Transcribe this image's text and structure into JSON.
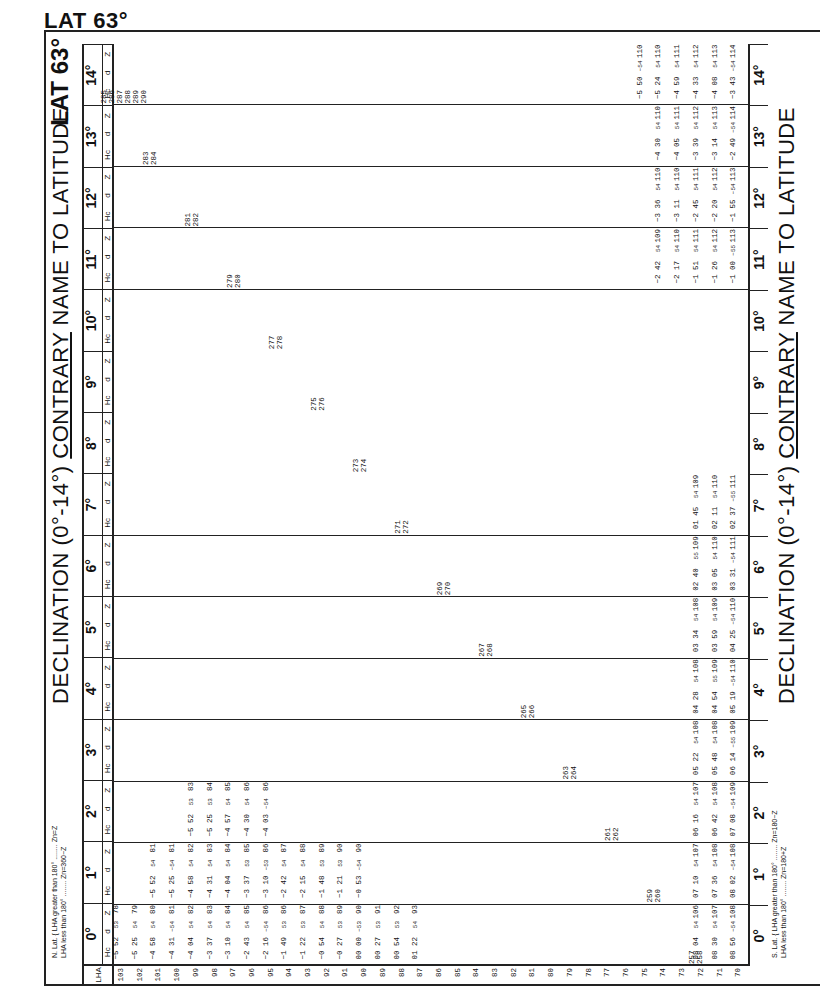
{
  "page": {
    "top_title": "LAT 63°",
    "side_title": "LAT 63°",
    "header_title_prefix": "DECLINATION (0°-14°)",
    "header_title_emph": "CONTRARY",
    "header_title_suffix": "NAME TO LATITUDE",
    "n_lat_rule_1": "N. Lat. { LHA greater than 180° ........ Zn=Z",
    "n_lat_rule_2": "LHA less than 180° ........ Zn=360−Z",
    "s_lat_rule_1": "S. Lat. { LHA greater than 180° ........ Zn=180−Z",
    "s_lat_rule_2": "LHA less than 180° ........ Zn=180+Z",
    "lha_label": "LHA",
    "subheads": {
      "hc": "Hc",
      "d": "d",
      "z": "Z"
    },
    "units": {
      "hc": "° ′",
      "d": "′",
      "z": "°"
    }
  },
  "declinations": [
    "0°",
    "1°",
    "2°",
    "3°",
    "4°",
    "5°",
    "6°",
    "7°",
    "8°",
    "9°",
    "10°",
    "11°",
    "12°",
    "13°",
    "14°"
  ],
  "lha_rows": [
    "103",
    "102",
    "101",
    "100",
    "99",
    "98",
    "97",
    "96",
    "95",
    "94",
    "93",
    "92",
    "91",
    "90",
    "89",
    "88",
    "87",
    "86",
    "85",
    "84",
    "83",
    "82",
    "81",
    "80",
    "79",
    "78",
    "77",
    "76",
    "75",
    "74",
    "73",
    "72",
    "71",
    "70"
  ],
  "staircase_lha": [
    {
      "decl": "0°",
      "lha": [
        "257",
        "258"
      ]
    },
    {
      "decl": "1°",
      "lha": [
        "259",
        "260"
      ]
    },
    {
      "decl": "2°",
      "lha": [
        "261",
        "262"
      ]
    },
    {
      "decl": "3°",
      "lha": [
        "263",
        "264"
      ]
    },
    {
      "decl": "4°",
      "lha": [
        "265",
        "266"
      ]
    },
    {
      "decl": "5°",
      "lha": [
        "267",
        "268"
      ]
    },
    {
      "decl": "6°",
      "lha": [
        "269",
        "270"
      ]
    },
    {
      "decl": "7°",
      "lha": [
        "271",
        "272"
      ]
    },
    {
      "decl": "8°",
      "lha": [
        "273",
        "274"
      ]
    },
    {
      "decl": "9°",
      "lha": [
        "275",
        "276"
      ]
    },
    {
      "decl": "10°",
      "lha": [
        "277",
        "278"
      ]
    },
    {
      "decl": "11°",
      "lha": [
        "279",
        "280"
      ]
    },
    {
      "decl": "12°",
      "lha": [
        "281",
        "282"
      ]
    },
    {
      "decl": "13°",
      "lha": [
        "283",
        "284"
      ]
    },
    {
      "decl": "14°",
      "lha": [
        "285",
        "286",
        "287",
        "288",
        "289",
        "290"
      ]
    }
  ],
  "table_samples": {
    "decl_0": [
      {
        "lha": "103",
        "hc": "−5 52",
        "d": "53",
        "z": "78"
      },
      {
        "lha": "102",
        "hc": "−5 25",
        "d": "54",
        "z": "79"
      },
      {
        "lha": "101",
        "hc": "−4 58",
        "d": "54",
        "z": "80"
      },
      {
        "lha": "100",
        "hc": "−4 31",
        "d": "−54",
        "z": "81"
      },
      {
        "lha": "99",
        "hc": "−4 04",
        "d": "54",
        "z": "82"
      },
      {
        "lha": "98",
        "hc": "−3 37",
        "d": "54",
        "z": "83"
      },
      {
        "lha": "97",
        "hc": "−3 10",
        "d": "54",
        "z": "84"
      },
      {
        "lha": "96",
        "hc": "−2 43",
        "d": "54",
        "z": "85"
      },
      {
        "lha": "95",
        "hc": "−2 16",
        "d": "−54",
        "z": "86"
      },
      {
        "lha": "94",
        "hc": "−1 49",
        "d": "53",
        "z": "86"
      },
      {
        "lha": "93",
        "hc": "−1 22",
        "d": "53",
        "z": "87"
      },
      {
        "lha": "92",
        "hc": "−0 54",
        "d": "54",
        "z": "88"
      },
      {
        "lha": "91",
        "hc": "−0 27",
        "d": "53",
        "z": "89"
      },
      {
        "lha": "90",
        "hc": "00 00",
        "d": "−53",
        "z": "90"
      },
      {
        "lha": "89",
        "hc": "00 27",
        "d": "53",
        "z": "91"
      },
      {
        "lha": "88",
        "hc": "00 54",
        "d": "53",
        "z": "92"
      },
      {
        "lha": "87",
        "hc": "01 22",
        "d": "54",
        "z": "93"
      },
      {
        "lha": "72",
        "hc": "08 04",
        "d": "54",
        "z": "106"
      },
      {
        "lha": "71",
        "hc": "08 30",
        "d": "54",
        "z": "107"
      },
      {
        "lha": "70",
        "hc": "08 56",
        "d": "−54",
        "z": "108"
      }
    ],
    "decl_1": [
      {
        "lha": "101",
        "hc": "−5 52",
        "d": "54",
        "z": "81"
      },
      {
        "lha": "100",
        "hc": "−5 25",
        "d": "−54",
        "z": "81"
      },
      {
        "lha": "99",
        "hc": "−4 58",
        "d": "54",
        "z": "82"
      },
      {
        "lha": "98",
        "hc": "−4 31",
        "d": "54",
        "z": "83"
      },
      {
        "lha": "97",
        "hc": "−4 04",
        "d": "54",
        "z": "84"
      },
      {
        "lha": "96",
        "hc": "−3 37",
        "d": "53",
        "z": "85"
      },
      {
        "lha": "95",
        "hc": "−3 10",
        "d": "−53",
        "z": "86"
      },
      {
        "lha": "94",
        "hc": "−2 42",
        "d": "54",
        "z": "87"
      },
      {
        "lha": "93",
        "hc": "−2 15",
        "d": "54",
        "z": "88"
      },
      {
        "lha": "92",
        "hc": "−1 48",
        "d": "53",
        "z": "89"
      },
      {
        "lha": "91",
        "hc": "−1 21",
        "d": "53",
        "z": "90"
      },
      {
        "lha": "90",
        "hc": "−0 53",
        "d": "−54",
        "z": "90"
      },
      {
        "lha": "72",
        "hc": "07 10",
        "d": "54",
        "z": "107"
      },
      {
        "lha": "71",
        "hc": "07 36",
        "d": "54",
        "z": "108"
      },
      {
        "lha": "70",
        "hc": "08 02",
        "d": "−54",
        "z": "108"
      }
    ],
    "decl_2": [
      {
        "lha": "99",
        "hc": "−5 52",
        "d": "53",
        "z": "83"
      },
      {
        "lha": "98",
        "hc": "−5 25",
        "d": "53",
        "z": "84"
      },
      {
        "lha": "97",
        "hc": "−4 57",
        "d": "54",
        "z": "85"
      },
      {
        "lha": "96",
        "hc": "−4 30",
        "d": "54",
        "z": "86"
      },
      {
        "lha": "95",
        "hc": "−4 03",
        "d": "−54",
        "z": "86"
      },
      {
        "lha": "72",
        "hc": "06 16",
        "d": "54",
        "z": "107"
      },
      {
        "lha": "71",
        "hc": "06 42",
        "d": "54",
        "z": "108"
      },
      {
        "lha": "70",
        "hc": "07 08",
        "d": "−54",
        "z": "109"
      }
    ],
    "decl_3": [
      {
        "lha": "72",
        "hc": "05 22",
        "d": "54",
        "z": "108"
      },
      {
        "lha": "71",
        "hc": "05 48",
        "d": "54",
        "z": "108"
      },
      {
        "lha": "70",
        "hc": "06 14",
        "d": "−55",
        "z": "109"
      }
    ],
    "decl_4": [
      {
        "lha": "72",
        "hc": "04 28",
        "d": "54",
        "z": "108"
      },
      {
        "lha": "71",
        "hc": "04 54",
        "d": "55",
        "z": "109"
      },
      {
        "lha": "70",
        "hc": "05 19",
        "d": "−54",
        "z": "110"
      }
    ],
    "decl_5": [
      {
        "lha": "72",
        "hc": "03 34",
        "d": "54",
        "z": "108"
      },
      {
        "lha": "71",
        "hc": "03 59",
        "d": "54",
        "z": "109"
      },
      {
        "lha": "70",
        "hc": "04 25",
        "d": "−54",
        "z": "110"
      }
    ],
    "decl_6": [
      {
        "lha": "72",
        "hc": "02 40",
        "d": "55",
        "z": "109"
      },
      {
        "lha": "71",
        "hc": "03 05",
        "d": "54",
        "z": "110"
      },
      {
        "lha": "70",
        "hc": "03 31",
        "d": "−54",
        "z": "111"
      }
    ],
    "decl_7": [
      {
        "lha": "72",
        "hc": "01 45",
        "d": "54",
        "z": "109"
      },
      {
        "lha": "71",
        "hc": "02 11",
        "d": "54",
        "z": "110"
      },
      {
        "lha": "70",
        "hc": "02 37",
        "d": "−55",
        "z": "111"
      }
    ],
    "decl_11": [
      {
        "lha": "74",
        "hc": "−2 42",
        "d": "54",
        "z": "109"
      },
      {
        "lha": "73",
        "hc": "−2 17",
        "d": "54",
        "z": "110"
      },
      {
        "lha": "72",
        "hc": "−1 51",
        "d": "54",
        "z": "111"
      },
      {
        "lha": "71",
        "hc": "−1 26",
        "d": "54",
        "z": "112"
      },
      {
        "lha": "70",
        "hc": "−1 00",
        "d": "−55",
        "z": "113"
      }
    ],
    "decl_12": [
      {
        "lha": "74",
        "hc": "−3 36",
        "d": "54",
        "z": "110"
      },
      {
        "lha": "73",
        "hc": "−3 11",
        "d": "54",
        "z": "110"
      },
      {
        "lha": "72",
        "hc": "−2 45",
        "d": "54",
        "z": "111"
      },
      {
        "lha": "71",
        "hc": "−2 20",
        "d": "54",
        "z": "112"
      },
      {
        "lha": "70",
        "hc": "−1 55",
        "d": "−54",
        "z": "113"
      }
    ],
    "decl_13": [
      {
        "lha": "74",
        "hc": "−4 30",
        "d": "54",
        "z": "110"
      },
      {
        "lha": "73",
        "hc": "−4 05",
        "d": "54",
        "z": "111"
      },
      {
        "lha": "72",
        "hc": "−3 39",
        "d": "54",
        "z": "112"
      },
      {
        "lha": "71",
        "hc": "−3 14",
        "d": "54",
        "z": "113"
      },
      {
        "lha": "70",
        "hc": "−2 49",
        "d": "−54",
        "z": "114"
      }
    ],
    "decl_14": [
      {
        "lha": "75",
        "hc": "−5 50",
        "d": "−54",
        "z": "110"
      },
      {
        "lha": "74",
        "hc": "−5 24",
        "d": "54",
        "z": "110"
      },
      {
        "lha": "73",
        "hc": "−4 59",
        "d": "54",
        "z": "111"
      },
      {
        "lha": "72",
        "hc": "−4 33",
        "d": "54",
        "z": "112"
      },
      {
        "lha": "71",
        "hc": "−4 08",
        "d": "54",
        "z": "113"
      },
      {
        "lha": "70",
        "hc": "−3 43",
        "d": "−54",
        "z": "114"
      }
    ]
  }
}
